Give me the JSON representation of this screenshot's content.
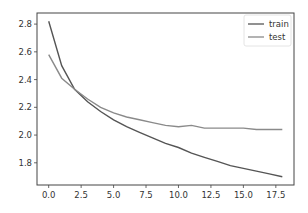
{
  "chart_data": {
    "type": "line",
    "title": "",
    "xlabel": "",
    "ylabel": "",
    "xlim": [
      -0.9,
      18.9
    ],
    "ylim": [
      1.64,
      2.88
    ],
    "grid": false,
    "legend_position": "upper right",
    "x_ticks": [
      0.0,
      2.5,
      5.0,
      7.5,
      10.0,
      12.5,
      15.0,
      17.5
    ],
    "x_tick_labels": [
      "0.0",
      "2.5",
      "5.0",
      "7.5",
      "10.0",
      "12.5",
      "15.0",
      "17.5"
    ],
    "y_ticks": [
      1.8,
      2.0,
      2.2,
      2.4,
      2.6,
      2.8
    ],
    "y_tick_labels": [
      "1.8",
      "2.0",
      "2.2",
      "2.4",
      "2.6",
      "2.8"
    ],
    "x": [
      0,
      1,
      2,
      3,
      4,
      5,
      6,
      7,
      8,
      9,
      10,
      11,
      12,
      13,
      14,
      15,
      16,
      17,
      18
    ],
    "series": [
      {
        "name": "train",
        "color": "#555555",
        "values": [
          2.82,
          2.5,
          2.33,
          2.24,
          2.17,
          2.11,
          2.06,
          2.02,
          1.98,
          1.94,
          1.91,
          1.87,
          1.84,
          1.81,
          1.78,
          1.76,
          1.74,
          1.72,
          1.7
        ]
      },
      {
        "name": "test",
        "color": "#8a8a8a",
        "values": [
          2.58,
          2.41,
          2.33,
          2.26,
          2.2,
          2.16,
          2.13,
          2.11,
          2.09,
          2.07,
          2.06,
          2.07,
          2.05,
          2.05,
          2.05,
          2.05,
          2.04,
          2.04,
          2.04
        ]
      }
    ]
  },
  "legend": {
    "items": [
      "train",
      "test"
    ]
  }
}
